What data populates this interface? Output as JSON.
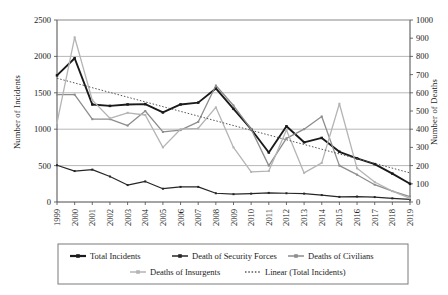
{
  "chart_data": {
    "type": "line",
    "title": "",
    "xlabel": "",
    "ylabel": "Number of Incidents",
    "y2label": "Number of Deaths",
    "grid": true,
    "legend_position": "bottom",
    "ylim": [
      0,
      2500
    ],
    "y2lim": [
      0,
      1000
    ],
    "yticks": [
      0,
      500,
      1000,
      1500,
      2000,
      2500
    ],
    "y2ticks": [
      0,
      100,
      200,
      300,
      400,
      500,
      600,
      700,
      800,
      900,
      1000
    ],
    "categories": [
      "1999",
      "2000",
      "2001",
      "2002",
      "2003",
      "2004",
      "2005",
      "2006",
      "2007",
      "2008",
      "2009",
      "2010",
      "2011",
      "2012",
      "2013",
      "2014",
      "2015",
      "2016",
      "2017",
      "2018",
      "2019"
    ],
    "series": [
      {
        "name": "Total Incidents",
        "axis": "left",
        "color": "#1a1a1a",
        "marker": "square",
        "width": 1.9,
        "values": [
          1740,
          1975,
          1340,
          1320,
          1340,
          1345,
          1230,
          1340,
          1365,
          1560,
          1280,
          1000,
          680,
          1040,
          820,
          880,
          690,
          600,
          520,
          390,
          250
        ]
      },
      {
        "name": "Death of Security Forces",
        "axis": "right",
        "color": "#262626",
        "marker": "square",
        "width": 1.2,
        "values": [
          202,
          170,
          178,
          140,
          93,
          113,
          73,
          83,
          83,
          48,
          43,
          46,
          50,
          48,
          46,
          38,
          28,
          30,
          27,
          20,
          14
        ]
      },
      {
        "name": "Deaths of Civilians",
        "axis": "right",
        "color": "#8d8d8d",
        "marker": "square",
        "width": 1.3,
        "values": [
          590,
          590,
          455,
          455,
          420,
          500,
          385,
          395,
          440,
          640,
          530,
          400,
          200,
          350,
          400,
          470,
          200,
          150,
          95,
          60,
          30
        ]
      },
      {
        "name": "Deaths of Insurgents",
        "axis": "right",
        "color": "#b4b4b4",
        "marker": "square",
        "width": 1.3,
        "values": [
          435,
          905,
          560,
          460,
          490,
          478,
          300,
          400,
          405,
          520,
          300,
          165,
          170,
          395,
          160,
          215,
          540,
          185,
          110,
          60,
          20
        ]
      }
    ],
    "trendline": {
      "name": "Linear (Total Incidents)",
      "axis": "left",
      "color": "#555555",
      "style": "dotted",
      "start_value": 1700,
      "end_value": 400
    }
  },
  "legend": {
    "items": [
      {
        "label": "Total Incidents",
        "color": "#1a1a1a",
        "style": "solid",
        "width": 2.2
      },
      {
        "label": "Death of Security Forces",
        "color": "#262626",
        "style": "solid",
        "width": 1.5
      },
      {
        "label": "Deaths of Civilians",
        "color": "#8d8d8d",
        "style": "solid",
        "width": 1.5
      },
      {
        "label": "Deaths of Insurgents",
        "color": "#b4b4b4",
        "style": "solid",
        "width": 1.5
      },
      {
        "label": "Linear (Total Incidents)",
        "color": "#555555",
        "style": "dotted",
        "width": 1.4
      }
    ]
  }
}
